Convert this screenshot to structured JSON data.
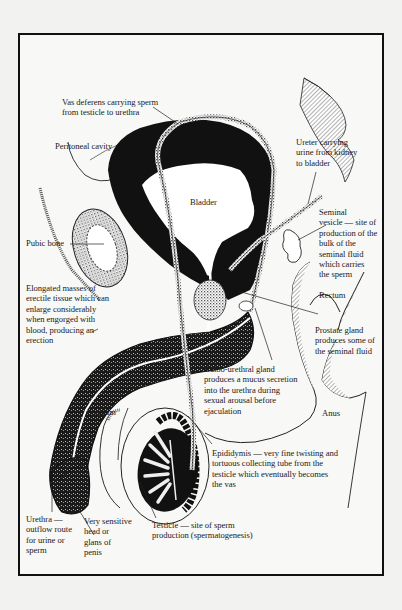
{
  "figure": {
    "colors": {
      "ink": "#111111",
      "paper": "#f8f8f6",
      "background": "#f2f2f0",
      "stipple": "#6a6a6a"
    },
    "labels": {
      "vas_deferens": "Vas deferens carrying sperm\nfrom testicle to urethra",
      "peritoneal_cavity": "Peritoneal cavity",
      "ureter": "Ureter carrying\nurine from kidney\nto bladder",
      "bladder": "Bladder",
      "pubic_bone": "Pubic bone",
      "seminal_vesicle": "Seminal\nvesicle — site of\nproduction of the\nbulk of the\nseminal fluid\nwhich carries\nthe sperm",
      "erectile_tissue": "Elongated masses of\nerectile tissue which can\nenlarge considerably\nwhen engorged with\nblood, producing an\nerection",
      "rectum": "Rectum",
      "prostate_gland": "Prostate gland\nproduces some of\nthe seminal fluid",
      "bulbo_urethral_gland": "Bulbo-urethral gland\nproduces a mucus secretion\ninto the urethra during\nsexual arousal before\nejaculation",
      "scrotum": "Scrotum",
      "anus": "Anus",
      "epididymis": "Epididymis — very fine twisting and\ntortuous collecting tube from the\ntesticle which eventually becomes\nthe vas",
      "urethra": "Urethra —\noutflow route\nfor urine or\nsperm",
      "glans": "Very sensitive\nhead or\nglans of\npenis",
      "testicle": "Testicle — site of sperm\nproduction (spermatogenesis)"
    }
  }
}
